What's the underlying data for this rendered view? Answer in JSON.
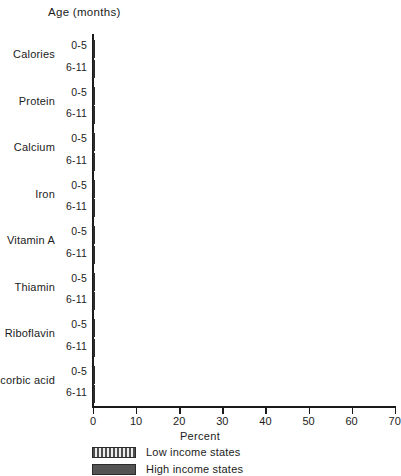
{
  "chart_data": {
    "type": "bar",
    "orientation": "horizontal",
    "title": "",
    "header_label": "Age (months)",
    "xlabel": "Percent",
    "ylabel": "",
    "xlim": [
      0,
      70
    ],
    "xticks": [
      0,
      10,
      20,
      30,
      40,
      50,
      60,
      70
    ],
    "xtick_labels": [
      "0",
      "10",
      "20",
      "30",
      "40",
      "50",
      "60",
      "70"
    ],
    "grid": false,
    "legend_position": "below-axis-left",
    "categories": [
      "Calories",
      "Protein",
      "Calcium",
      "Iron",
      "Vitamin A",
      "Thiamin",
      "Riboflavin",
      "Ascorbic acid"
    ],
    "age_groups": [
      "0-5",
      "6-11"
    ],
    "series": [
      {
        "name": "Low income states",
        "pattern": "vertical-hatch",
        "color": "#8d8d8d",
        "values_0_5": [
          29,
          12.5,
          10.5,
          47.5,
          13,
          15.5,
          2.5,
          50
        ],
        "values_6_11": [
          23,
          4.5,
          2,
          69,
          16,
          27,
          2,
          53
        ]
      },
      {
        "name": "High income states",
        "pattern": "solid",
        "color": "#545454",
        "values_0_5": [
          13,
          7.5,
          8,
          40,
          9.5,
          1,
          2.5,
          34.5
        ],
        "values_6_11": [
          13,
          3,
          2,
          60,
          14,
          20,
          2.5,
          50
        ]
      }
    ]
  }
}
